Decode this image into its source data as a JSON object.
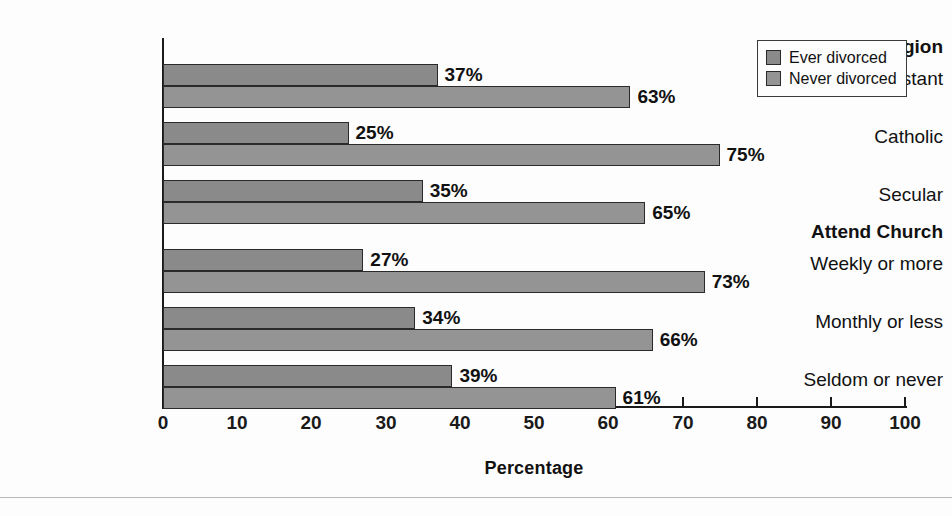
{
  "chart_data": {
    "type": "bar",
    "orientation": "horizontal",
    "title": "",
    "xlabel": "Percentage",
    "ylabel": "",
    "xlim": [
      0,
      100
    ],
    "xticks": [
      0,
      10,
      20,
      30,
      40,
      50,
      60,
      70,
      80,
      90,
      100
    ],
    "grid": false,
    "legend_position": "top-right",
    "groups": [
      {
        "header": "Religion",
        "categories": [
          "Protestant",
          "Catholic",
          "Secular"
        ],
        "values": {
          "Ever divorced": [
            37,
            25,
            35
          ],
          "Never divorced": [
            63,
            75,
            65
          ]
        }
      },
      {
        "header": "Attend Church",
        "categories": [
          "Weekly or more",
          "Monthly or less",
          "Seldom or never"
        ],
        "values": {
          "Ever divorced": [
            27,
            34,
            39
          ],
          "Never divorced": [
            73,
            66,
            61
          ]
        }
      }
    ],
    "categories": [
      "Protestant",
      "Catholic",
      "Secular",
      "Weekly or more",
      "Monthly or less",
      "Seldom or never"
    ],
    "series": [
      {
        "name": "Ever divorced",
        "values": [
          37,
          25,
          35,
          27,
          34,
          39
        ],
        "color": "#8a8a8a"
      },
      {
        "name": "Never divorced",
        "values": [
          63,
          75,
          65,
          73,
          66,
          61
        ],
        "color": "#949494"
      }
    ],
    "data_labels": [
      "37%",
      "63%",
      "25%",
      "75%",
      "35%",
      "65%",
      "27%",
      "73%",
      "34%",
      "66%",
      "39%",
      "61%"
    ]
  },
  "legend": {
    "items": [
      {
        "label": "Ever divorced",
        "color": "#8a8a8a"
      },
      {
        "label": "Never divorced",
        "color": "#949494"
      }
    ]
  },
  "axis": {
    "x_title": "Percentage",
    "ticks": [
      "0",
      "10",
      "20",
      "30",
      "40",
      "50",
      "60",
      "70",
      "80",
      "90",
      "100"
    ]
  },
  "labels": {
    "group_religion": "Religion",
    "group_attend": "Attend Church",
    "cat_protestant": "Protestant",
    "cat_catholic": "Catholic",
    "cat_secular": "Secular",
    "cat_weekly": "Weekly or more",
    "cat_monthly": "Monthly or less",
    "cat_seldom": "Seldom or never"
  },
  "bars": [
    {
      "id": "protestant-ever",
      "category": "Protestant",
      "series": "Ever divorced",
      "value": 37,
      "label": "37%"
    },
    {
      "id": "protestant-never",
      "category": "Protestant",
      "series": "Never divorced",
      "value": 63,
      "label": "63%"
    },
    {
      "id": "catholic-ever",
      "category": "Catholic",
      "series": "Ever divorced",
      "value": 25,
      "label": "25%"
    },
    {
      "id": "catholic-never",
      "category": "Catholic",
      "series": "Never divorced",
      "value": 75,
      "label": "75%"
    },
    {
      "id": "secular-ever",
      "category": "Secular",
      "series": "Ever divorced",
      "value": 35,
      "label": "35%"
    },
    {
      "id": "secular-never",
      "category": "Secular",
      "series": "Never divorced",
      "value": 65,
      "label": "65%"
    },
    {
      "id": "weekly-ever",
      "category": "Weekly or more",
      "series": "Ever divorced",
      "value": 27,
      "label": "27%"
    },
    {
      "id": "weekly-never",
      "category": "Weekly or more",
      "series": "Never divorced",
      "value": 73,
      "label": "73%"
    },
    {
      "id": "monthly-ever",
      "category": "Monthly or less",
      "series": "Ever divorced",
      "value": 34,
      "label": "34%"
    },
    {
      "id": "monthly-never",
      "category": "Monthly or less",
      "series": "Never divorced",
      "value": 66,
      "label": "66%"
    },
    {
      "id": "seldom-ever",
      "category": "Seldom or never",
      "series": "Ever divorced",
      "value": 39,
      "label": "39%"
    },
    {
      "id": "seldom-never",
      "category": "Seldom or never",
      "series": "Never divorced",
      "value": 61,
      "label": "61%"
    }
  ]
}
